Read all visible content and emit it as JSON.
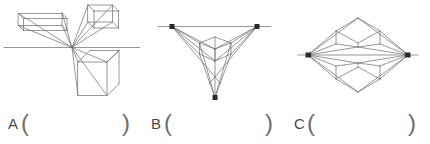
{
  "page": {
    "background_color": "#ffffff",
    "line_color": "#6b6b6b",
    "text_color": "#4a4a4a",
    "width": 430,
    "height": 144
  },
  "questions": [
    {
      "id": "a",
      "label": "A",
      "open_paren": "(",
      "close_paren": ")",
      "answer_value": "",
      "answer_placeholder": "",
      "figure": {
        "name": "one-point-perspective-diagram",
        "description": "One-point perspective: three rectangular boxes radiating from a single vanishing point on a horizon line",
        "vanishing_points": 1,
        "horizon_line": true,
        "boxes": 3
      }
    },
    {
      "id": "b",
      "label": "B",
      "open_paren": "(",
      "close_paren": ")",
      "answer_value": "",
      "answer_placeholder": "",
      "figure": {
        "name": "three-point-perspective-diagram",
        "description": "Three-point perspective: a cube with converging lines to two horizon vanishing points and one lower vanishing point",
        "vanishing_points": 3,
        "horizon_line": true,
        "boxes": 1
      }
    },
    {
      "id": "c",
      "label": "C",
      "open_paren": "(",
      "close_paren": ")",
      "answer_value": "",
      "answer_placeholder": "",
      "figure": {
        "name": "two-point-perspective-diagram",
        "description": "Two-point perspective: two boxes with lines converging to left and right vanishing points on a horizon line",
        "vanishing_points": 2,
        "horizon_line": true,
        "boxes": 2
      }
    }
  ]
}
